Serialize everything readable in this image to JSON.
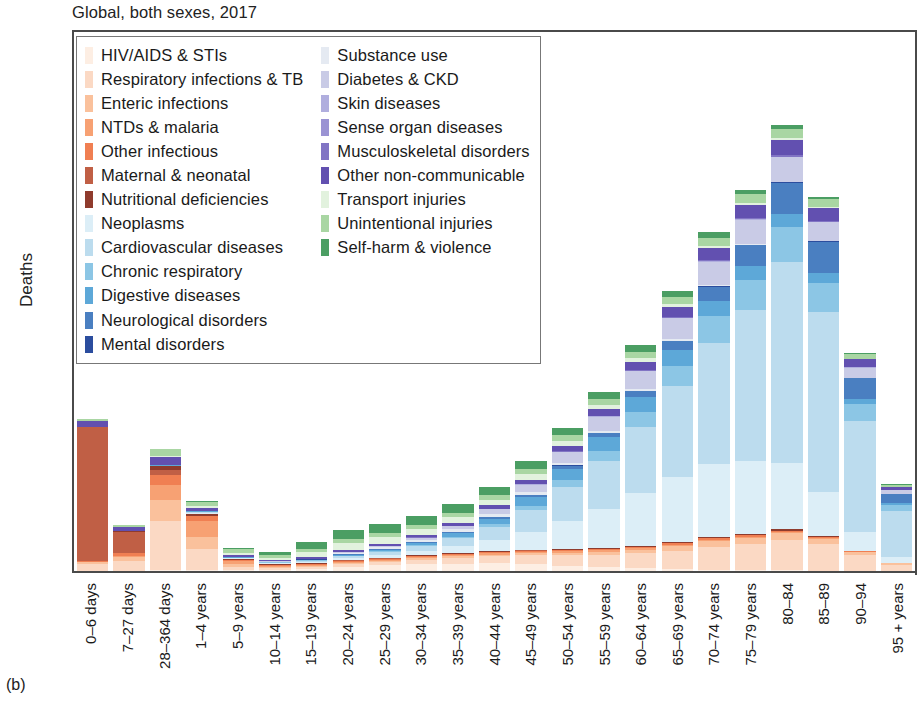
{
  "chart": {
    "title": "Global, both sexes, 2017",
    "panel_label": "(b)",
    "ylabel": "Deaths"
  },
  "axes": {
    "yticks": [
      "0",
      "1M",
      "2M",
      "3M",
      "4M",
      "5M",
      "6M"
    ],
    "ytick_values": [
      0,
      1,
      2,
      3,
      4,
      5,
      6
    ]
  },
  "chart_data": {
    "type": "bar",
    "subtype": "stacked-bar",
    "title": "Global, both sexes, 2017",
    "xlabel": "",
    "ylabel": "Deaths",
    "ylim": [
      0,
      6.2
    ],
    "ytick_labels": [
      "0",
      "1M",
      "2M",
      "3M",
      "4M",
      "5M",
      "6M"
    ],
    "grid": false,
    "legend_position": "upper-left-inside",
    "units": "millions of deaths",
    "categories": [
      "0–6 days",
      "7–27 days",
      "28–364 days",
      "1–4 years",
      "5–9 years",
      "10–14 years",
      "15–19 years",
      "20–24 years",
      "25–29 years",
      "30–34 years",
      "35–39 years",
      "40–44 years",
      "45–49 years",
      "50–54 years",
      "55–59 years",
      "60–64 years",
      "65–69 years",
      "70–74 years",
      "75–79 years",
      "80–84",
      "85–89",
      "90–94",
      "95 + years"
    ],
    "totals": [
      1.74,
      0.53,
      1.4,
      0.76,
      0.27,
      0.22,
      0.4,
      0.52,
      0.56,
      0.67,
      0.83,
      1.06,
      1.44,
      1.95,
      2.43,
      3.02,
      3.78,
      4.57,
      5.21,
      6.09,
      4.96,
      2.85,
      1.15
    ],
    "series": [
      {
        "name": "HIV/AIDS & STIs",
        "color": "#fdeee3",
        "values": [
          0.005,
          0.004,
          0.012,
          0.012,
          0.01,
          0.011,
          0.025,
          0.047,
          0.063,
          0.075,
          0.084,
          0.086,
          0.08,
          0.062,
          0.044,
          0.031,
          0.021,
          0.014,
          0.009,
          0.006,
          0.003,
          0.001,
          0.0
        ]
      },
      {
        "name": "Respiratory infections & TB",
        "color": "#fbd9c4",
        "values": [
          0.075,
          0.115,
          0.56,
          0.235,
          0.04,
          0.024,
          0.026,
          0.035,
          0.042,
          0.053,
          0.066,
          0.081,
          0.098,
          0.118,
          0.14,
          0.172,
          0.212,
          0.263,
          0.3,
          0.345,
          0.3,
          0.178,
          0.074
        ]
      },
      {
        "name": "Enteric infections",
        "color": "#fac19c",
        "values": [
          0.02,
          0.038,
          0.235,
          0.145,
          0.025,
          0.013,
          0.011,
          0.012,
          0.013,
          0.015,
          0.018,
          0.021,
          0.025,
          0.03,
          0.035,
          0.042,
          0.051,
          0.062,
          0.07,
          0.078,
          0.064,
          0.036,
          0.014
        ]
      },
      {
        "name": "NTDs & malaria",
        "color": "#f7a173",
        "values": [
          0.004,
          0.02,
          0.18,
          0.175,
          0.037,
          0.015,
          0.011,
          0.011,
          0.011,
          0.012,
          0.013,
          0.014,
          0.015,
          0.016,
          0.016,
          0.017,
          0.017,
          0.016,
          0.014,
          0.012,
          0.008,
          0.004,
          0.001
        ]
      },
      {
        "name": "Other infectious",
        "color": "#f07f52",
        "values": [
          0.012,
          0.03,
          0.115,
          0.06,
          0.013,
          0.008,
          0.008,
          0.009,
          0.01,
          0.011,
          0.012,
          0.013,
          0.014,
          0.015,
          0.016,
          0.017,
          0.018,
          0.018,
          0.016,
          0.014,
          0.01,
          0.005,
          0.002
        ]
      },
      {
        "name": "Maternal & neonatal",
        "color": "#c05f45",
        "values": [
          1.53,
          0.24,
          0.055,
          0.006,
          0.002,
          0.002,
          0.004,
          0.007,
          0.008,
          0.008,
          0.007,
          0.005,
          0.003,
          0.002,
          0.001,
          0.001,
          0.0,
          0.0,
          0.0,
          0.0,
          0.0,
          0.0,
          0.0
        ]
      },
      {
        "name": "Nutritional deficiencies",
        "color": "#8f3b2d",
        "values": [
          0.004,
          0.006,
          0.04,
          0.022,
          0.005,
          0.003,
          0.003,
          0.003,
          0.003,
          0.004,
          0.004,
          0.005,
          0.006,
          0.007,
          0.008,
          0.01,
          0.012,
          0.015,
          0.017,
          0.02,
          0.017,
          0.01,
          0.004
        ]
      },
      {
        "name": "Neoplasms",
        "color": "#dceef7",
        "values": [
          0.0,
          0.0,
          0.002,
          0.012,
          0.013,
          0.013,
          0.018,
          0.024,
          0.032,
          0.048,
          0.077,
          0.126,
          0.204,
          0.318,
          0.449,
          0.6,
          0.74,
          0.84,
          0.83,
          0.76,
          0.5,
          0.215,
          0.06
        ]
      },
      {
        "name": "Cardiovascular diseases",
        "color": "#bcdcee",
        "values": [
          0.0,
          0.0,
          0.002,
          0.004,
          0.005,
          0.007,
          0.012,
          0.022,
          0.036,
          0.058,
          0.093,
          0.152,
          0.25,
          0.39,
          0.55,
          0.76,
          1.04,
          1.38,
          1.72,
          2.29,
          2.06,
          1.27,
          0.53
        ]
      },
      {
        "name": "Chronic respiratory",
        "color": "#8cc6e5",
        "values": [
          0.0,
          0.0,
          0.003,
          0.006,
          0.004,
          0.004,
          0.005,
          0.007,
          0.009,
          0.013,
          0.019,
          0.03,
          0.05,
          0.08,
          0.115,
          0.165,
          0.23,
          0.3,
          0.35,
          0.4,
          0.33,
          0.19,
          0.075
        ]
      },
      {
        "name": "Digestive diseases",
        "color": "#5da8d8",
        "values": [
          0.0,
          0.0,
          0.003,
          0.005,
          0.004,
          0.004,
          0.006,
          0.01,
          0.016,
          0.026,
          0.042,
          0.066,
          0.098,
          0.132,
          0.155,
          0.172,
          0.182,
          0.18,
          0.162,
          0.15,
          0.11,
          0.06,
          0.022
        ]
      },
      {
        "name": "Neurological disorders",
        "color": "#4a7fc1",
        "values": [
          0.0,
          0.0,
          0.002,
          0.003,
          0.003,
          0.003,
          0.003,
          0.004,
          0.005,
          0.007,
          0.01,
          0.015,
          0.023,
          0.034,
          0.048,
          0.07,
          0.105,
          0.16,
          0.235,
          0.36,
          0.36,
          0.23,
          0.095
        ]
      },
      {
        "name": "Mental disorders",
        "color": "#2b4d9e",
        "values": [
          0.0,
          0.0,
          0.0,
          0.0,
          0.0,
          0.0,
          0.001,
          0.001,
          0.001,
          0.001,
          0.002,
          0.002,
          0.002,
          0.003,
          0.003,
          0.003,
          0.004,
          0.004,
          0.005,
          0.005,
          0.004,
          0.003,
          0.001
        ]
      },
      {
        "name": "Substance use",
        "color": "#e5eaf2",
        "values": [
          0.0,
          0.0,
          0.0,
          0.0,
          0.0,
          0.001,
          0.004,
          0.012,
          0.021,
          0.028,
          0.032,
          0.033,
          0.032,
          0.029,
          0.025,
          0.021,
          0.017,
          0.013,
          0.009,
          0.006,
          0.003,
          0.001,
          0.0
        ]
      },
      {
        "name": "Diabetes & CKD",
        "color": "#c9cbe6",
        "values": [
          0.0,
          0.0,
          0.002,
          0.004,
          0.004,
          0.005,
          0.007,
          0.01,
          0.015,
          0.023,
          0.036,
          0.057,
          0.087,
          0.124,
          0.16,
          0.2,
          0.238,
          0.268,
          0.272,
          0.28,
          0.215,
          0.12,
          0.046
        ]
      },
      {
        "name": "Skin diseases",
        "color": "#b0aede",
        "values": [
          0.0,
          0.0,
          0.0,
          0.0,
          0.0,
          0.0,
          0.0,
          0.001,
          0.001,
          0.001,
          0.001,
          0.002,
          0.002,
          0.003,
          0.003,
          0.004,
          0.005,
          0.006,
          0.007,
          0.008,
          0.007,
          0.004,
          0.002
        ]
      },
      {
        "name": "Sense organ diseases",
        "color": "#9a93d3",
        "values": [
          0.0,
          0.0,
          0.0,
          0.0,
          0.0,
          0.0,
          0.0,
          0.0,
          0.0,
          0.0,
          0.0,
          0.0,
          0.0,
          0.0,
          0.0,
          0.0,
          0.0,
          0.0,
          0.0,
          0.0,
          0.0,
          0.0,
          0.0
        ]
      },
      {
        "name": "Musculoskeletal disorders",
        "color": "#8174c4",
        "values": [
          0.0,
          0.0,
          0.0,
          0.0,
          0.0,
          0.0,
          0.0,
          0.001,
          0.001,
          0.002,
          0.002,
          0.003,
          0.004,
          0.006,
          0.007,
          0.009,
          0.011,
          0.013,
          0.014,
          0.015,
          0.012,
          0.007,
          0.003
        ]
      },
      {
        "name": "Other non-communicable",
        "color": "#6250b0",
        "values": [
          0.06,
          0.048,
          0.09,
          0.034,
          0.017,
          0.015,
          0.018,
          0.022,
          0.026,
          0.031,
          0.037,
          0.044,
          0.053,
          0.064,
          0.076,
          0.092,
          0.112,
          0.136,
          0.152,
          0.175,
          0.145,
          0.085,
          0.034
        ]
      },
      {
        "name": "Transport injuries",
        "color": "#e2f2de",
        "values": [
          0.0,
          0.0,
          0.008,
          0.022,
          0.025,
          0.024,
          0.056,
          0.078,
          0.072,
          0.066,
          0.062,
          0.06,
          0.058,
          0.054,
          0.048,
          0.042,
          0.035,
          0.029,
          0.023,
          0.018,
          0.011,
          0.005,
          0.002
        ]
      },
      {
        "name": "Unintentional injuries",
        "color": "#a9d6a3",
        "values": [
          0.026,
          0.028,
          0.082,
          0.045,
          0.04,
          0.031,
          0.038,
          0.046,
          0.048,
          0.05,
          0.052,
          0.055,
          0.058,
          0.062,
          0.066,
          0.072,
          0.08,
          0.09,
          0.1,
          0.112,
          0.09,
          0.055,
          0.022
        ]
      },
      {
        "name": "Self-harm & violence",
        "color": "#4b9e63",
        "values": [
          0.0,
          0.0,
          0.004,
          0.008,
          0.015,
          0.03,
          0.075,
          0.105,
          0.105,
          0.1,
          0.098,
          0.096,
          0.094,
          0.09,
          0.085,
          0.078,
          0.07,
          0.062,
          0.052,
          0.044,
          0.028,
          0.014,
          0.005
        ]
      }
    ]
  },
  "legend": {
    "column_left": [
      {
        "label": "HIV/AIDS & STIs",
        "color": "#fdeee3"
      },
      {
        "label": "Respiratory infections & TB",
        "color": "#fbd9c4"
      },
      {
        "label": "Enteric infections",
        "color": "#fac19c"
      },
      {
        "label": "NTDs & malaria",
        "color": "#f7a173"
      },
      {
        "label": "Other infectious",
        "color": "#f07f52"
      },
      {
        "label": "Maternal & neonatal",
        "color": "#c05f45"
      },
      {
        "label": "Nutritional deficiencies",
        "color": "#8f3b2d"
      },
      {
        "label": "Neoplasms",
        "color": "#dceef7"
      },
      {
        "label": "Cardiovascular diseases",
        "color": "#bcdcee"
      },
      {
        "label": "Chronic respiratory",
        "color": "#8cc6e5"
      },
      {
        "label": "Digestive diseases",
        "color": "#5da8d8"
      },
      {
        "label": "Neurological disorders",
        "color": "#4a7fc1"
      },
      {
        "label": "Mental disorders",
        "color": "#2b4d9e"
      }
    ],
    "column_right": [
      {
        "label": "Substance use",
        "color": "#e5eaf2"
      },
      {
        "label": "Diabetes & CKD",
        "color": "#c9cbe6"
      },
      {
        "label": "Skin diseases",
        "color": "#b0aede"
      },
      {
        "label": "Sense organ diseases",
        "color": "#9a93d3"
      },
      {
        "label": "Musculoskeletal disorders",
        "color": "#8174c4"
      },
      {
        "label": "Other non-communicable",
        "color": "#6250b0"
      },
      {
        "label": "Transport injuries",
        "color": "#e2f2de"
      },
      {
        "label": "Unintentional injuries",
        "color": "#a9d6a3"
      },
      {
        "label": "Self-harm & violence",
        "color": "#4b9e63"
      }
    ]
  }
}
